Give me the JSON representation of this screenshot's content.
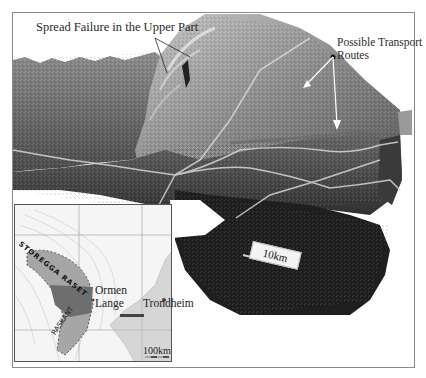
{
  "figure": {
    "type": "3D bathymetric relief with inset location map",
    "background_color": "#ffffff",
    "frame_color": "#8a8a8a"
  },
  "annotations": {
    "spread_failure": "Spread Failure in the Upper Part",
    "transport_routes": "Possible Transport Routes",
    "scale_main": "10km"
  },
  "inset_map": {
    "labels": {
      "ormen": "Ormen",
      "lange": "Lange",
      "trondheim": "Trondheim",
      "scale": "100km",
      "storegga": "STOREGGA RASET",
      "slide_edge": "RASKANT",
      "coast_label": "KRISTIANSUND"
    },
    "colors": {
      "slide_area": "#9a9a9a",
      "slide_core": "#6e6e6e",
      "land_contours": "#bdbdbd"
    }
  },
  "relief": {
    "colors": {
      "upper_slope": "#8c8c8c",
      "headwall": "#bfbfbf",
      "slide_floor": "#4a4a4a",
      "deep_basin": "#1e1e1e",
      "channel_lines": "#d8d8d8"
    }
  }
}
